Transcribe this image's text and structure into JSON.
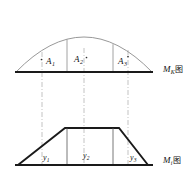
{
  "figure": {
    "title_upper": "M",
    "upper_diagram": {
      "label_base": "M",
      "label_subscript": "K",
      "label_suffix": "图",
      "area_labels": [
        {
          "name": "A",
          "subscript": "1",
          "x": 48,
          "y": 62,
          "dot_x": 41,
          "dot_y": 59
        },
        {
          "name": "A",
          "subscript": "2",
          "x": 74,
          "y": 60,
          "dot_x": 87,
          "dot_y": 57
        },
        {
          "name": "A",
          "subscript": "3",
          "x": 118,
          "y": 62,
          "dot_x": 128,
          "dot_y": 57
        }
      ],
      "baseline_y": 72,
      "arc_left_x": 16,
      "arc_right_x": 152,
      "arc_apex_y": 36,
      "divider_x": [
        67,
        113
      ]
    },
    "lower_diagram": {
      "label_base": "M",
      "label_subscript": "i",
      "label_suffix": "图",
      "ordinate_labels": [
        {
          "name": "y",
          "subscript": "1",
          "x": 44,
          "y": 158
        },
        {
          "name": "y",
          "subscript": "2",
          "x": 84,
          "y": 157
        },
        {
          "name": "y",
          "subscript": "3",
          "x": 131,
          "y": 159
        }
      ],
      "baseline_y": 165,
      "top_y": 128,
      "left_foot_x": 18,
      "right_foot_x": 148,
      "left_shoulder_x": 65,
      "right_shoulder_x": 119,
      "divider_x": [
        67,
        113
      ]
    },
    "projection_lines_x": [
      42,
      84,
      128
    ],
    "colors": {
      "stroke_dark": "#1a1a1a",
      "stroke_thin": "#555555",
      "stroke_dashdot": "#999999",
      "background": "#ffffff"
    }
  }
}
